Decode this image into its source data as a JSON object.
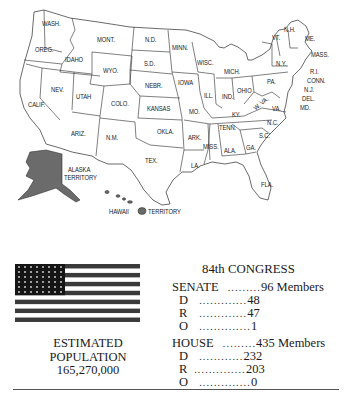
{
  "map": {
    "title": "United States map (84th Congress era)",
    "states": [
      {
        "abbr": "WASH.",
        "x": 42,
        "y": 24
      },
      {
        "abbr": "OREG.",
        "x": 35,
        "y": 49
      },
      {
        "abbr": "IDAHO",
        "x": 64,
        "y": 58
      },
      {
        "abbr": "MONT.",
        "x": 96,
        "y": 37
      },
      {
        "abbr": "N.D.",
        "x": 144,
        "y": 37
      },
      {
        "abbr": "MINN.",
        "x": 171,
        "y": 44
      },
      {
        "abbr": "WYO.",
        "x": 101,
        "y": 68
      },
      {
        "abbr": "S.D.",
        "x": 143,
        "y": 60
      },
      {
        "abbr": "WISC.",
        "x": 197,
        "y": 58
      },
      {
        "abbr": "MICH.",
        "x": 225,
        "y": 67
      },
      {
        "abbr": "NEV.",
        "x": 48,
        "y": 85
      },
      {
        "abbr": "UTAH",
        "x": 74,
        "y": 92
      },
      {
        "abbr": "NEBR.",
        "x": 144,
        "y": 82
      },
      {
        "abbr": "IOWA",
        "x": 177,
        "y": 78
      },
      {
        "abbr": "CALIF.",
        "x": 27,
        "y": 101
      },
      {
        "abbr": "COLO.",
        "x": 110,
        "y": 101
      },
      {
        "abbr": "KANSAS",
        "x": 147,
        "y": 106
      },
      {
        "abbr": "ILL.",
        "x": 203,
        "y": 91
      },
      {
        "abbr": "IND.",
        "x": 222,
        "y": 93
      },
      {
        "abbr": "OHIO",
        "x": 237,
        "y": 87
      },
      {
        "abbr": "PA.",
        "x": 266,
        "y": 78
      },
      {
        "abbr": "MO.",
        "x": 187,
        "y": 107
      },
      {
        "abbr": "KY.",
        "x": 229,
        "y": 109
      },
      {
        "abbr": "W. VA.",
        "x": 255,
        "y": 104
      },
      {
        "abbr": "VA.",
        "x": 271,
        "y": 105
      },
      {
        "abbr": "ARIZ.",
        "x": 69,
        "y": 130
      },
      {
        "abbr": "N.M.",
        "x": 103,
        "y": 134
      },
      {
        "abbr": "OKLA.",
        "x": 154,
        "y": 128
      },
      {
        "abbr": "ARK.",
        "x": 186,
        "y": 134
      },
      {
        "abbr": "TENN.",
        "x": 218,
        "y": 124
      },
      {
        "abbr": "N.C.",
        "x": 266,
        "y": 119
      },
      {
        "abbr": "S.C.",
        "x": 259,
        "y": 132
      },
      {
        "abbr": "MISS.",
        "x": 200,
        "y": 143
      },
      {
        "abbr": "ALA.",
        "x": 221,
        "y": 146
      },
      {
        "abbr": "GA.",
        "x": 244,
        "y": 144
      },
      {
        "abbr": "TEX.",
        "x": 145,
        "y": 157
      },
      {
        "abbr": "LA.",
        "x": 190,
        "y": 162
      },
      {
        "abbr": "FLA.",
        "x": 259,
        "y": 181
      },
      {
        "abbr": "N.Y.",
        "x": 276,
        "y": 60
      },
      {
        "abbr": "VT.",
        "x": 272,
        "y": 34
      },
      {
        "abbr": "N.H.",
        "x": 284,
        "y": 27
      },
      {
        "abbr": "ME.",
        "x": 304,
        "y": 34
      },
      {
        "abbr": "MASS.",
        "x": 310,
        "y": 51
      },
      {
        "abbr": "R.I.",
        "x": 309,
        "y": 68
      },
      {
        "abbr": "CONN.",
        "x": 306,
        "y": 77
      },
      {
        "abbr": "N.J.",
        "x": 303,
        "y": 86
      },
      {
        "abbr": "DEL.",
        "x": 301,
        "y": 95
      },
      {
        "abbr": "MD.",
        "x": 299,
        "y": 104
      }
    ],
    "territories": [
      {
        "name": "ALASKA",
        "sub": "TERRITORY",
        "x": 64,
        "y": 166
      },
      {
        "name": "HAWAII",
        "sub": "TERRITORY",
        "x": 107,
        "y": 208
      }
    ],
    "colors": {
      "territory_fill": "#6b6b6b",
      "state_fill": "#ffffff",
      "border": "#2a2a2a"
    }
  },
  "flag": {
    "stars": 48,
    "stripes": 13,
    "colors": {
      "dark": "#3a3a3a",
      "light": "#ffffff"
    }
  },
  "population": {
    "line1": "ESTIMATED",
    "line2": "POPULATION",
    "value": "165,270,000"
  },
  "congress": {
    "title": "84th CONGRESS",
    "senate": {
      "label": "SENATE",
      "dots": ".........",
      "total": "96 Members",
      "rows": [
        {
          "party": "D",
          "dots": ".............",
          "value": "48"
        },
        {
          "party": "R",
          "dots": ".............",
          "value": "47"
        },
        {
          "party": "O",
          "dots": "..............",
          "value": "1"
        }
      ]
    },
    "house": {
      "label": "HOUSE",
      "dots": ".........",
      "total": "435 Members",
      "rows": [
        {
          "party": "D",
          "dots": "............",
          "value": "232"
        },
        {
          "party": "R",
          "dots": "..............",
          "value": "203"
        },
        {
          "party": "O",
          "dots": "..............",
          "value": "0"
        }
      ]
    }
  }
}
